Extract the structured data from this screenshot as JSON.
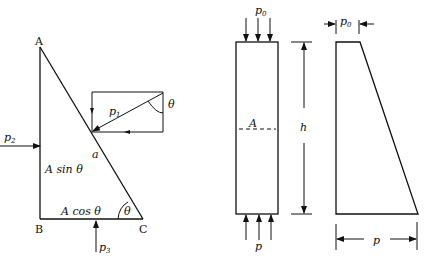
{
  "left_figure": {
    "vertices": {
      "A": "A",
      "B": "B",
      "C": "C"
    },
    "labels": {
      "p1": "p",
      "p1_sub": "1",
      "p2": "p",
      "p2_sub": "2",
      "p3": "p",
      "p3_sub": "3",
      "a": "a",
      "vertical_side": "A sin θ",
      "horizontal_side": "A cos θ",
      "theta_angle_c": "θ",
      "theta_angle_rect": "θ"
    }
  },
  "right_figure": {
    "column": {
      "top_load": "p",
      "top_load_sub": "0",
      "bottom_load": "p",
      "section_label": "A",
      "height_label": "h"
    },
    "pressure_diagram": {
      "top_width": "p",
      "top_width_sub": "0",
      "bottom_width": "p"
    }
  },
  "colors": {
    "line": "#111111",
    "background": "#ffffff"
  }
}
